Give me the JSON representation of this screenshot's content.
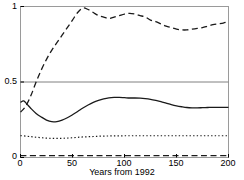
{
  "chart_data": {
    "type": "line",
    "title": "",
    "subtitle": "",
    "xlabel": "Years from 1992",
    "ylabel": "",
    "xlim": [
      0,
      200
    ],
    "ylim": [
      0,
      1
    ],
    "grid": false,
    "legend": null,
    "xticks": [
      0,
      50,
      100,
      150,
      200
    ],
    "xticklabels": [
      "0",
      "50",
      "100",
      "150",
      "200"
    ],
    "yticks": [
      0,
      0.5,
      1
    ],
    "yticklabels": [
      "0",
      "0.5",
      "1"
    ],
    "reference_lines": [
      {
        "name": "half-probability-line",
        "orientation": "horizontal",
        "value": 0.5,
        "color": "#808080",
        "style": "solid"
      }
    ],
    "series": [
      {
        "name": "upper-dashed-curve",
        "style": "dashed",
        "color": "#1a1a1a",
        "x": [
          0,
          5,
          10,
          15,
          20,
          25,
          30,
          35,
          40,
          45,
          50,
          55,
          60,
          65,
          70,
          75,
          80,
          85,
          90,
          95,
          100,
          105,
          110,
          115,
          120,
          125,
          130,
          135,
          140,
          145,
          150,
          155,
          160,
          165,
          170,
          175,
          180,
          185,
          190,
          195,
          200
        ],
        "y": [
          0.3,
          0.34,
          0.41,
          0.5,
          0.58,
          0.65,
          0.71,
          0.76,
          0.81,
          0.86,
          0.91,
          0.96,
          0.99,
          0.98,
          0.96,
          0.94,
          0.93,
          0.92,
          0.93,
          0.94,
          0.95,
          0.955,
          0.95,
          0.94,
          0.93,
          0.91,
          0.9,
          0.885,
          0.87,
          0.86,
          0.85,
          0.845,
          0.845,
          0.85,
          0.855,
          0.86,
          0.87,
          0.88,
          0.885,
          0.89,
          0.9
        ]
      },
      {
        "name": "middle-solid-curve",
        "style": "solid",
        "color": "#1a1a1a",
        "x": [
          0,
          3,
          6,
          10,
          15,
          20,
          25,
          30,
          35,
          40,
          45,
          50,
          55,
          60,
          65,
          70,
          75,
          80,
          85,
          90,
          95,
          100,
          105,
          110,
          115,
          120,
          125,
          130,
          135,
          140,
          145,
          150,
          155,
          160,
          165,
          170,
          175,
          180,
          185,
          190,
          195,
          200
        ],
        "y": [
          0.365,
          0.375,
          0.355,
          0.325,
          0.292,
          0.268,
          0.248,
          0.237,
          0.238,
          0.248,
          0.263,
          0.283,
          0.305,
          0.328,
          0.348,
          0.365,
          0.378,
          0.388,
          0.395,
          0.398,
          0.398,
          0.396,
          0.394,
          0.394,
          0.393,
          0.39,
          0.385,
          0.378,
          0.37,
          0.36,
          0.35,
          0.342,
          0.336,
          0.331,
          0.329,
          0.329,
          0.33,
          0.331,
          0.332,
          0.332,
          0.332,
          0.332
        ]
      },
      {
        "name": "lower-dotted-curve",
        "style": "dotted",
        "color": "#1a1a1a",
        "x": [
          0,
          10,
          20,
          30,
          40,
          50,
          60,
          70,
          80,
          90,
          100,
          110,
          120,
          130,
          140,
          150,
          160,
          170,
          180,
          190,
          200
        ],
        "y": [
          0.145,
          0.138,
          0.131,
          0.127,
          0.127,
          0.131,
          0.136,
          0.139,
          0.142,
          0.143,
          0.144,
          0.144,
          0.144,
          0.144,
          0.144,
          0.144,
          0.144,
          0.144,
          0.144,
          0.144,
          0.144
        ]
      },
      {
        "name": "baseline-dashed-curve",
        "style": "dashed",
        "color": "#1a1a1a",
        "x": [
          0,
          25,
          50,
          75,
          100,
          125,
          150,
          175,
          200
        ],
        "y": [
          0.012,
          0.012,
          0.012,
          0.012,
          0.012,
          0.012,
          0.012,
          0.012,
          0.012
        ]
      }
    ]
  },
  "axes": {
    "frame_color": "#999999",
    "tick_color": "#000000",
    "text_color": "#000000"
  }
}
